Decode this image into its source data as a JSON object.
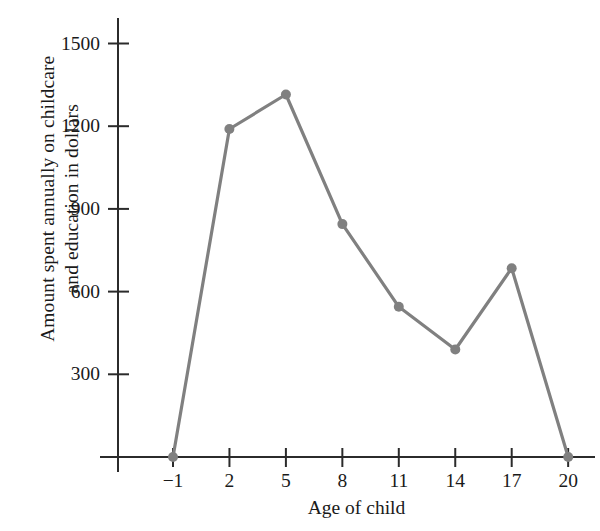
{
  "chart_data": {
    "type": "line",
    "title": "",
    "xlabel": "Age of child",
    "ylabel": "Amount spent annually on childcare and education in dollars",
    "ylabel_lines": [
      "Amount spent annually on childcare",
      "and education in dollars"
    ],
    "x": [
      -1,
      2,
      5,
      8,
      11,
      14,
      17,
      20
    ],
    "values": [
      0,
      1190,
      1315,
      845,
      545,
      390,
      685,
      0
    ],
    "xtick_labels": [
      "−1",
      "2",
      "5",
      "8",
      "11",
      "14",
      "17",
      "20"
    ],
    "ytick_labels": [
      "300",
      "600",
      "900",
      "1200",
      "1500"
    ],
    "ytick_values": [
      300,
      600,
      900,
      1200,
      1500
    ],
    "xlim": [
      -1,
      20
    ],
    "ylim": [
      0,
      1600
    ],
    "grid": false,
    "legend": null,
    "series_color": "#808080",
    "axis_color": "#2b2b2b",
    "marker": "circle",
    "points": [
      {
        "x": -1,
        "y": 0
      },
      {
        "x": 2,
        "y": 1190
      },
      {
        "x": 5,
        "y": 1315
      },
      {
        "x": 8,
        "y": 845
      },
      {
        "x": 11,
        "y": 545
      },
      {
        "x": 14,
        "y": 390
      },
      {
        "x": 17,
        "y": 685
      },
      {
        "x": 20,
        "y": 0
      }
    ]
  }
}
